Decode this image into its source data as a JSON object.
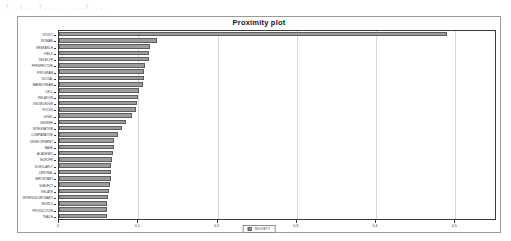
{
  "topband_text": "f  .  ,  r      .   ,   .   f   ,   .    .    ,  .   .    .   ,  .   f   .   ,   .    .",
  "panel": {
    "title": "Proximity plot"
  },
  "legend": {
    "label": "SOCIETY",
    "swatch_color": "#9c9c9c"
  },
  "axis": {
    "x_ticks": [
      "0",
      "0.1",
      "0.2",
      "0.3",
      "0.4",
      "0.5"
    ],
    "x_tick_values": [
      0,
      0.1,
      0.2,
      0.3,
      0.4,
      0.5
    ]
  },
  "chart_data": {
    "type": "bar",
    "orientation": "horizontal",
    "title": "Proximity plot",
    "xlabel": "",
    "ylabel": "",
    "xlim": [
      0,
      0.55
    ],
    "grid": true,
    "legend_position": "bottom",
    "series": [
      {
        "name": "SOCIETY",
        "color": "#9c9c9c"
      }
    ],
    "categories": [
      "STUDY",
      "WOMAN",
      "RESEARCH",
      "FIELD",
      "DEVELOP",
      "PERSPECTIVE",
      "PROGRAM",
      "SOCIAL",
      "MAINSTREAM",
      "CELL",
      "RELATION",
      "KNOWLEDGE",
      "FOCUS",
      "LEVEL",
      "DEGREE",
      "INTEGRATIVE",
      "COMPARATIVE",
      "DEVELOPMENT",
      "BASE",
      "ACADEMIC",
      "EUROPE",
      "SCHOLARLY",
      "CENTRAL",
      "IMPORTANT",
      "SUBJECT",
      "RELATE",
      "INTERDISCIPLINARY",
      "WORLD",
      "PRODUCTION",
      "TEACH"
    ],
    "values": [
      0.49,
      0.123,
      0.115,
      0.114,
      0.113,
      0.108,
      0.107,
      0.107,
      0.106,
      0.101,
      0.1,
      0.098,
      0.097,
      0.092,
      0.085,
      0.08,
      0.074,
      0.07,
      0.069,
      0.068,
      0.067,
      0.066,
      0.065,
      0.065,
      0.064,
      0.063,
      0.062,
      0.061,
      0.061,
      0.06
    ]
  }
}
